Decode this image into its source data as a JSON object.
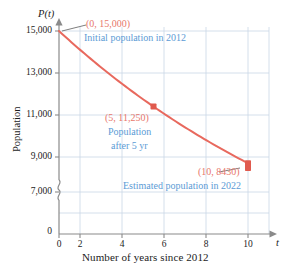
{
  "chart_data": {
    "type": "line",
    "title": "",
    "xlabel": "Number of years since 2012",
    "ylabel": "Population",
    "x_axis_symbol": "t",
    "y_axis_symbol": "P(t)",
    "x": [
      0,
      5,
      10
    ],
    "values": [
      15000,
      11250,
      8430
    ],
    "series": [
      {
        "name": "Population",
        "x": [
          0,
          5,
          10
        ],
        "values": [
          15000,
          11250,
          8430
        ],
        "color": "#e8695e"
      }
    ],
    "xlim": [
      0,
      11
    ],
    "ylim": [
      7000,
      15000
    ],
    "y_axis_break": true,
    "y_break_symbol": "≈",
    "grid": true,
    "grid_color": "#c9d7e6",
    "legend": "none",
    "xticks": [
      "0",
      "2",
      "4",
      "6",
      "8",
      "10"
    ],
    "xtick_values": [
      0,
      2,
      4,
      6,
      8,
      10
    ],
    "yticks": [
      "0",
      "7,000",
      "9,000",
      "11,000",
      "13,000",
      "15,000"
    ],
    "ytick_values": [
      0,
      7000,
      9000,
      11000,
      13000,
      15000
    ],
    "annotations": [
      {
        "coord_label": "(0, 15,000)",
        "note": "Initial population in 2012",
        "point": [
          0,
          15000
        ]
      },
      {
        "coord_label": "(5, 11,250)",
        "note_line1": "Population",
        "note_line2": "after 5 yr",
        "point": [
          5,
          11250
        ]
      },
      {
        "coord_label": "(10, 8430)",
        "note": "Estimated population in 2022",
        "point": [
          10,
          8430
        ]
      }
    ],
    "colors": {
      "curve": "#e8695e",
      "marker": "#e05a4e",
      "coord_text": "#e8776b",
      "note_text": "#5b9bd5",
      "grid": "#c9d7e6",
      "axis": "#8a8a8a",
      "leader": "#6f6f6f"
    }
  }
}
